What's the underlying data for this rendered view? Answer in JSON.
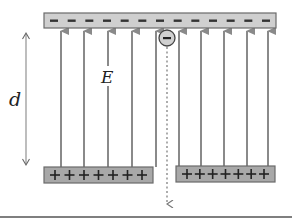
{
  "diagram": {
    "labels": {
      "distance": "d",
      "field": "E"
    },
    "top_plate": {
      "charge": "negative",
      "symbol": "−",
      "count": 13,
      "x": 44,
      "y": 13,
      "w": 232,
      "h": 15
    },
    "bottom_plates": [
      {
        "charge": "positive",
        "symbol": "+",
        "count": 7,
        "x": 44,
        "y": 167,
        "w": 109,
        "h": 16
      },
      {
        "charge": "positive",
        "symbol": "+",
        "count": 7,
        "x": 176,
        "y": 166,
        "w": 99,
        "h": 16
      }
    ],
    "field_lines_x": [
      61,
      84,
      108,
      132,
      156,
      179,
      201,
      224,
      247,
      268
    ],
    "electron": {
      "symbol": "−",
      "cx": 167,
      "cy": 38,
      "r": 8,
      "path": "dashed-downward"
    },
    "colors": {
      "plate_fill": "#c8c8c8",
      "plate_fill_bottom": "#a8a8a8",
      "plate_stroke": "#6a6a6a",
      "field_line": "#8a8a8a",
      "text": "#222222"
    }
  }
}
